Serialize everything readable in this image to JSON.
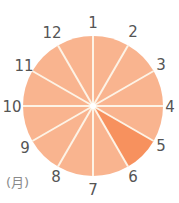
{
  "diagram": {
    "type": "month-wheel",
    "unit_label": "(月)",
    "center": [
      93,
      106
    ],
    "radius": 70,
    "colors": {
      "sector": "#F9B48F",
      "highlight": "#F7915E",
      "divider": "#FDF3E6",
      "label": "#555555"
    },
    "months": [
      {
        "label": "1",
        "x": 93,
        "y": 23
      },
      {
        "label": "2",
        "x": 133,
        "y": 32
      },
      {
        "label": "3",
        "x": 161,
        "y": 65
      },
      {
        "label": "4",
        "x": 170,
        "y": 107
      },
      {
        "label": "5",
        "x": 161,
        "y": 146
      },
      {
        "label": "6",
        "x": 133,
        "y": 177
      },
      {
        "label": "7",
        "x": 93,
        "y": 190
      },
      {
        "label": "8",
        "x": 56,
        "y": 177
      },
      {
        "label": "9",
        "x": 25,
        "y": 148
      },
      {
        "label": "10",
        "x": 12,
        "y": 107
      },
      {
        "label": "11",
        "x": 24,
        "y": 66
      },
      {
        "label": "12",
        "x": 52,
        "y": 33
      }
    ],
    "highlighted_sector": {
      "from": "5",
      "to": "6"
    }
  }
}
